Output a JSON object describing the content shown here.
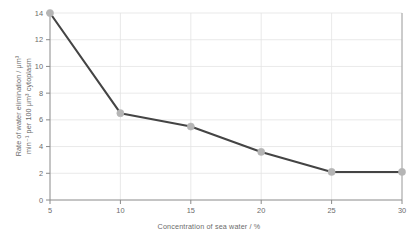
{
  "chart_data": {
    "type": "line",
    "title": "",
    "subtitle": "",
    "xlabel": "Concentration of sea water / %",
    "ylabel": "Rate of water elimination / μm³ min⁻¹ per 100 μm³ cytoplasm",
    "ylabel_line1": "Rate of water elimination / μm³",
    "ylabel_line2": "min⁻¹ per 100 μm³ cytoplasm",
    "x": [
      5,
      10,
      15,
      20,
      25,
      30
    ],
    "values": [
      14.0,
      6.5,
      5.5,
      3.6,
      2.1,
      2.1
    ],
    "series": [
      {
        "name": "Rate of water elimination",
        "values": [
          14.0,
          6.5,
          5.5,
          3.6,
          2.1,
          2.1
        ]
      }
    ],
    "xlim": [
      5,
      30
    ],
    "ylim": [
      0,
      14
    ],
    "xticks": [
      "5",
      "10",
      "15",
      "20",
      "25",
      "30"
    ],
    "yticks": [
      "0",
      "2",
      "4",
      "6",
      "8",
      "10",
      "12",
      "14"
    ],
    "xtick_values": [
      5,
      10,
      15,
      20,
      25,
      30
    ],
    "ytick_values": [
      0,
      2,
      4,
      6,
      8,
      10,
      12,
      14
    ],
    "grid": true,
    "grid_color": "#e3e3e3",
    "legend": false,
    "legend_position": "none",
    "line_color": "#444444",
    "marker_color": "#b5b5b5",
    "marker_shape": "circle",
    "axis_color": "#8a8a8a",
    "background": "#ffffff",
    "annotations": []
  }
}
